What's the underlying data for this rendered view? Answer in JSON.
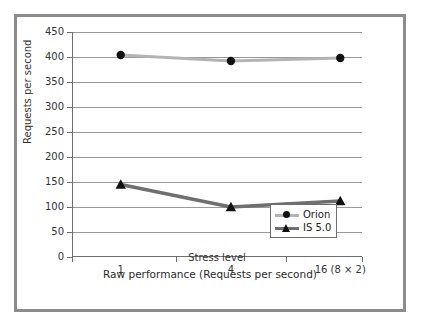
{
  "chart_data": {
    "type": "line",
    "title": "",
    "xlabel": "Stress level",
    "ylabel": "Requests per second",
    "caption": "Raw performance (Requests per second)",
    "categories": [
      "1",
      "4",
      "16 (8 × 2)"
    ],
    "ylim": [
      0,
      450
    ],
    "y_ticks": [
      "0",
      "50",
      "100",
      "150",
      "200",
      "250",
      "300",
      "350",
      "400",
      "450"
    ],
    "y_tick_values": [
      0,
      50,
      100,
      150,
      200,
      250,
      300,
      350,
      400,
      450
    ],
    "grid": "horizontal",
    "legend_position": "bottom-right-inside",
    "series": [
      {
        "name": "Orion",
        "values": [
          404,
          392,
          398
        ],
        "color": "#b4b4b4",
        "marker": "circle",
        "marker_color": "#111111"
      },
      {
        "name": "IS 5.0",
        "values": [
          145,
          100,
          112
        ],
        "color": "#6f6f6f",
        "marker": "triangle",
        "marker_color": "#111111"
      }
    ]
  },
  "figure": {
    "frame_color": "#8c8c8c",
    "background": "#ffffff",
    "axis_color": "#6e6e6e",
    "gridline_color": "#9a9a9a"
  },
  "legend": {
    "items": [
      {
        "label": "Orion"
      },
      {
        "label": "IS 5.0"
      }
    ]
  },
  "axes": {
    "y_title": "Requests per second",
    "x_title": "Stress level"
  },
  "caption": {
    "text": "Raw performance (Requests per second)"
  }
}
